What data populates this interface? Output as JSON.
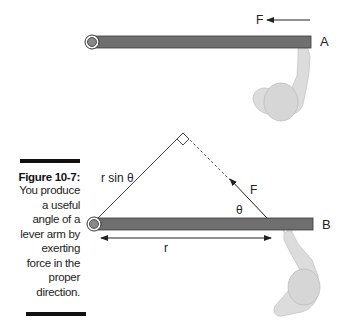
{
  "caption": {
    "figure_label": "Figure 10-7:",
    "lines": [
      "You produce",
      "a useful",
      "angle of a",
      "lever arm by",
      "exerting",
      "force in the",
      "proper",
      "direction."
    ]
  },
  "diagram_a": {
    "label": "A",
    "force_label": "F"
  },
  "diagram_b": {
    "label": "B",
    "force_label": "F",
    "angle_label": "θ",
    "lever_label": "r sin θ",
    "radius_label": "r"
  },
  "colors": {
    "bar_fill": "#6f6f6f",
    "bar_stroke": "#3a3a3a",
    "figure_fill": "#d9d9d9",
    "figure_stroke": "#bdbdbd",
    "text": "#222222"
  }
}
